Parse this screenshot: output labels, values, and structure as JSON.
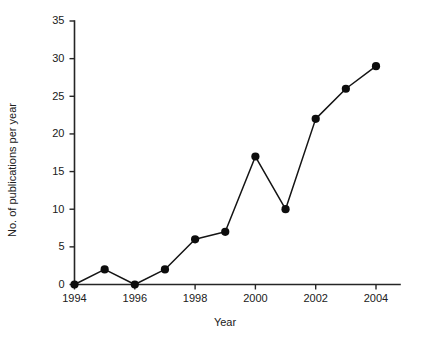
{
  "chart_data": {
    "type": "line",
    "title": "",
    "xlabel": "Year",
    "ylabel": "No. of publications per year",
    "x": [
      1994,
      1995,
      1996,
      1997,
      1998,
      1999,
      2000,
      2001,
      2002,
      2003,
      2004
    ],
    "values": [
      0,
      2,
      0,
      2,
      6,
      7,
      17,
      10,
      22,
      26,
      29
    ],
    "series": [
      {
        "name": "Publications",
        "values": [
          0,
          2,
          0,
          2,
          6,
          7,
          17,
          10,
          22,
          26,
          29
        ]
      }
    ],
    "xtick_labels": [
      "1994",
      "1996",
      "1998",
      "2000",
      "2002",
      "2004"
    ],
    "xtick_values": [
      1994,
      1996,
      1998,
      2000,
      2002,
      2004
    ],
    "ytick_labels": [
      "0",
      "5",
      "10",
      "15",
      "20",
      "25",
      "30",
      "35"
    ],
    "ytick_values": [
      0,
      5,
      10,
      15,
      20,
      25,
      30,
      35
    ],
    "xlim": [
      1993.6,
      1994.0
    ],
    "ylim": [
      0,
      35
    ],
    "grid": false,
    "legend": false,
    "marker": "filled-circle",
    "line_color": "#141414",
    "marker_color": "#0d0d0d",
    "background_color": "#ffffff"
  }
}
